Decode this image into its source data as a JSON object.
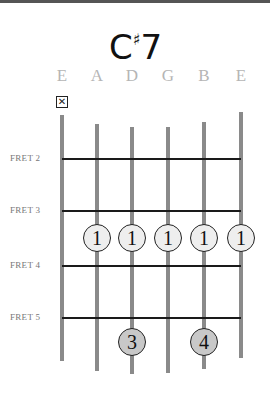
{
  "chord": {
    "root": "C",
    "accidental": "♯",
    "quality": "7",
    "name": "C♯7"
  },
  "strings": [
    {
      "label": "E",
      "x": 62,
      "top": 115,
      "bottom": 361
    },
    {
      "label": "A",
      "x": 97,
      "top": 124,
      "bottom": 371
    },
    {
      "label": "D",
      "x": 132,
      "top": 127,
      "bottom": 374
    },
    {
      "label": "G",
      "x": 168,
      "top": 127,
      "bottom": 373
    },
    {
      "label": "B",
      "x": 204,
      "top": 122,
      "bottom": 369
    },
    {
      "label": "E",
      "x": 241,
      "top": 112,
      "bottom": 358
    }
  ],
  "muted": [
    {
      "string": 0,
      "symbol": "✕"
    }
  ],
  "frets": [
    {
      "label": "FRET 2",
      "y": 159
    },
    {
      "label": "FRET 3",
      "y": 211
    },
    {
      "label": "FRET 4",
      "y": 266
    },
    {
      "label": "FRET 5",
      "y": 318
    }
  ],
  "fingers": [
    {
      "string": 1,
      "fret": 3,
      "finger": "1",
      "style": "light",
      "x": 97,
      "y": 238
    },
    {
      "string": 2,
      "fret": 3,
      "finger": "1",
      "style": "light",
      "x": 132,
      "y": 238
    },
    {
      "string": 3,
      "fret": 3,
      "finger": "1",
      "style": "light",
      "x": 168,
      "y": 238
    },
    {
      "string": 4,
      "fret": 3,
      "finger": "1",
      "style": "light",
      "x": 204,
      "y": 238
    },
    {
      "string": 5,
      "fret": 3,
      "finger": "1",
      "style": "light",
      "x": 241,
      "y": 238
    },
    {
      "string": 2,
      "fret": 5,
      "finger": "3",
      "style": "dark",
      "x": 132,
      "y": 342
    },
    {
      "string": 4,
      "fret": 5,
      "finger": "4",
      "style": "dark",
      "x": 204,
      "y": 342
    }
  ],
  "colors": {
    "string": "#8a8a8a",
    "fret": "#1a1a1a",
    "label": "#b5b5b5",
    "dot_light": "#eeeeee",
    "dot_dark": "#c8c8c8"
  }
}
